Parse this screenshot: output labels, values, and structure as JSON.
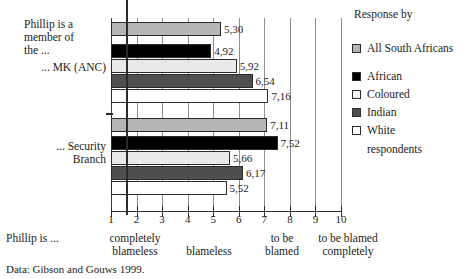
{
  "chart_data": {
    "type": "bar",
    "orientation": "horizontal",
    "title": "",
    "xlabel": "Phillip is ...",
    "ylabel": "",
    "xlim": [
      1,
      10
    ],
    "xticks": [
      1,
      2,
      3,
      4,
      5,
      6,
      7,
      8,
      9,
      10
    ],
    "xticklabels": [
      "1",
      "2",
      "3",
      "4",
      "5",
      "6",
      "7",
      "8",
      "9",
      "10"
    ],
    "grid": true,
    "legend_position": "right",
    "reference_line": 5.5,
    "value_label_decimal_separator": ",",
    "categories": [
      "Phillip is a member of the ... MK (ANC)",
      "Phillip is a member of the ... Security Branch"
    ],
    "series": [
      {
        "name": "All South Africans",
        "color": "#b4b4b4",
        "values": [
          5.3,
          7.11
        ]
      },
      {
        "name": "African",
        "color": "#000000",
        "values": [
          4.92,
          7.52
        ]
      },
      {
        "name": "Coloured",
        "color": "#e9e9e9",
        "values": [
          5.92,
          5.66
        ]
      },
      {
        "name": "Indian",
        "color": "#4f4f4f",
        "values": [
          6.54,
          6.17
        ]
      },
      {
        "name": "White",
        "color": "#ffffff",
        "values": [
          7.16,
          5.52
        ]
      }
    ],
    "bars": [
      {
        "group": 0,
        "series": "All South Africans",
        "value": 5.3,
        "label": "5,30",
        "style": "s-all"
      },
      {
        "group": 0,
        "series": "African",
        "value": 4.92,
        "label": "4,92",
        "style": "s-african"
      },
      {
        "group": 0,
        "series": "Coloured",
        "value": 5.92,
        "label": "5,92",
        "style": "s-coloured"
      },
      {
        "group": 0,
        "series": "Indian",
        "value": 6.54,
        "label": "6,54",
        "style": "s-indian"
      },
      {
        "group": 0,
        "series": "White",
        "value": 7.16,
        "label": "7,16",
        "style": "s-white"
      },
      {
        "group": 1,
        "series": "All South Africans",
        "value": 7.11,
        "label": "7,11",
        "style": "s-all"
      },
      {
        "group": 1,
        "series": "African",
        "value": 7.52,
        "label": "7,52",
        "style": "s-african"
      },
      {
        "group": 1,
        "series": "Coloured",
        "value": 5.66,
        "label": "5,66",
        "style": "s-coloured"
      },
      {
        "group": 1,
        "series": "Indian",
        "value": 6.17,
        "label": "6,17",
        "style": "s-indian"
      },
      {
        "group": 1,
        "series": "White",
        "value": 5.52,
        "label": "5,52",
        "style": "s-white"
      }
    ],
    "annotations": [
      {
        "name": "completely-blameless",
        "text": "completely\nblameless",
        "near_value": 2
      },
      {
        "name": "blameless",
        "text": "blameless",
        "near_value": 4
      },
      {
        "name": "to-be-blamed",
        "text": "to be\nblamed",
        "near_value": 7
      },
      {
        "name": "to-be-blamed-completely",
        "text": "to be blamed\ncompletely",
        "near_value": 9
      }
    ]
  },
  "categories": {
    "group1_line1": "Phillip is a",
    "group1_line2": "member of",
    "group1_line3": "the ...",
    "group1_sub": "... MK (ANC)",
    "group2_line1": "... Security",
    "group2_line2": "Branch"
  },
  "xaxis": {
    "ticks": [
      "1",
      "2",
      "3",
      "4",
      "5",
      "6",
      "7",
      "8",
      "9",
      "10"
    ]
  },
  "annotations": {
    "prefix": "Phillip is ...",
    "completely": "completely",
    "blameless_left": "blameless",
    "blameless_mid": "blameless",
    "to_be": "to be",
    "blamed": "blamed",
    "to_be_blamed": "to be blamed",
    "completely_right": "completely"
  },
  "legend": {
    "title": "Response by",
    "items": [
      {
        "label": "All South Africans",
        "style": "s-all"
      },
      {
        "label": "African",
        "style": "s-african"
      },
      {
        "label": "Coloured",
        "style": "s-coloured"
      },
      {
        "label": "Indian",
        "style": "s-indian"
      },
      {
        "label": "White",
        "style": "s-white"
      }
    ],
    "footer": "respondents"
  },
  "source": {
    "text": "Data: Gibson and Gouws 1999."
  },
  "colors": {
    "all_south_africans": "#b4b4b4",
    "african": "#000000",
    "coloured": "#e9e9e9",
    "indian": "#4f4f4f",
    "white": "#ffffff",
    "axis": "#2b2b2b",
    "grid": "#8d8d8d"
  }
}
